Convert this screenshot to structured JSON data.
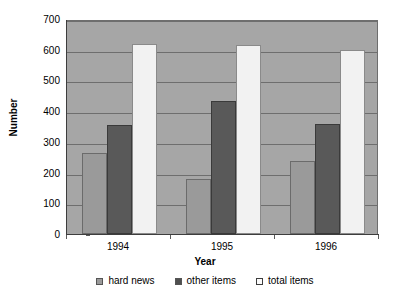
{
  "chart_data": {
    "type": "bar",
    "title": "",
    "subtitle": "",
    "xlabel": "Year",
    "ylabel": "Number",
    "categories": [
      "1994",
      "1995",
      "1996"
    ],
    "series": [
      {
        "name": "hard news",
        "values": [
          265,
          180,
          238
        ],
        "color": "#9a9a9a"
      },
      {
        "name": "other items",
        "values": [
          355,
          433,
          357
        ],
        "color": "#595959"
      },
      {
        "name": "total items",
        "values": [
          620,
          617,
          598
        ],
        "color": "#f2f2f2"
      }
    ],
    "ylim": [
      0,
      700
    ],
    "ytick_step": 100,
    "yticks": [
      "0",
      "100",
      "200",
      "300",
      "400",
      "500",
      "600",
      "700"
    ],
    "grid": true,
    "grid_axis": "y",
    "legend_position": "bottom",
    "plot_background": "#a6a6a6",
    "figure_background": "#ffffff"
  },
  "legend": {
    "items": [
      {
        "label": "hard news"
      },
      {
        "label": "other items"
      },
      {
        "label": "total items"
      }
    ]
  }
}
